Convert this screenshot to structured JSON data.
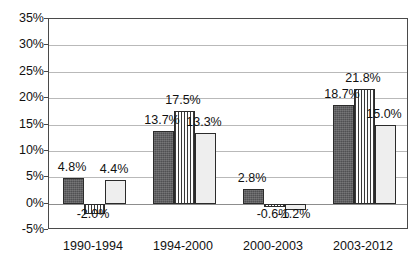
{
  "chart_data": {
    "type": "bar",
    "title": "",
    "subtitle": "",
    "xlabel": "",
    "ylabel": "",
    "categories": [
      "1990-1994",
      "1994-2000",
      "2000-2003",
      "2003-2012"
    ],
    "series": [
      {
        "name": "series-1",
        "style": "dark-solid",
        "color": "#5a5a5c",
        "values": [
          4.8,
          13.7,
          2.8,
          18.7
        ]
      },
      {
        "name": "series-2",
        "style": "vertical-stripes",
        "color": "#ffffff",
        "values": [
          -2.0,
          17.5,
          -0.6,
          21.8
        ]
      },
      {
        "name": "series-3",
        "style": "light-solid",
        "color": "#eeeeee",
        "values": [
          4.4,
          13.3,
          -1.2,
          15.0
        ]
      }
    ],
    "data_labels": [
      [
        "4.8%",
        "-2.0%",
        "4.4%"
      ],
      [
        "13.7%",
        "17.5%",
        "13.3%"
      ],
      [
        "2.8%",
        "-0.6%",
        "-1.2%"
      ],
      [
        "18.7%",
        "21.8%",
        "15.0%"
      ]
    ],
    "ylim": [
      -5,
      35
    ],
    "ytick_values": [
      35,
      30,
      25,
      20,
      15,
      10,
      5,
      0,
      -5
    ],
    "ytick_labels": [
      "35%",
      "30%",
      "25%",
      "20%",
      "15%",
      "10%",
      "5%",
      "0%",
      "-5%"
    ],
    "grid": true,
    "legend": "none",
    "axis_color": "#4a4a4a",
    "gridline_color": "#b9b9b9",
    "zero_line_color": "#8d8d8d",
    "text_color": "#111111",
    "background": "#ffffff"
  }
}
